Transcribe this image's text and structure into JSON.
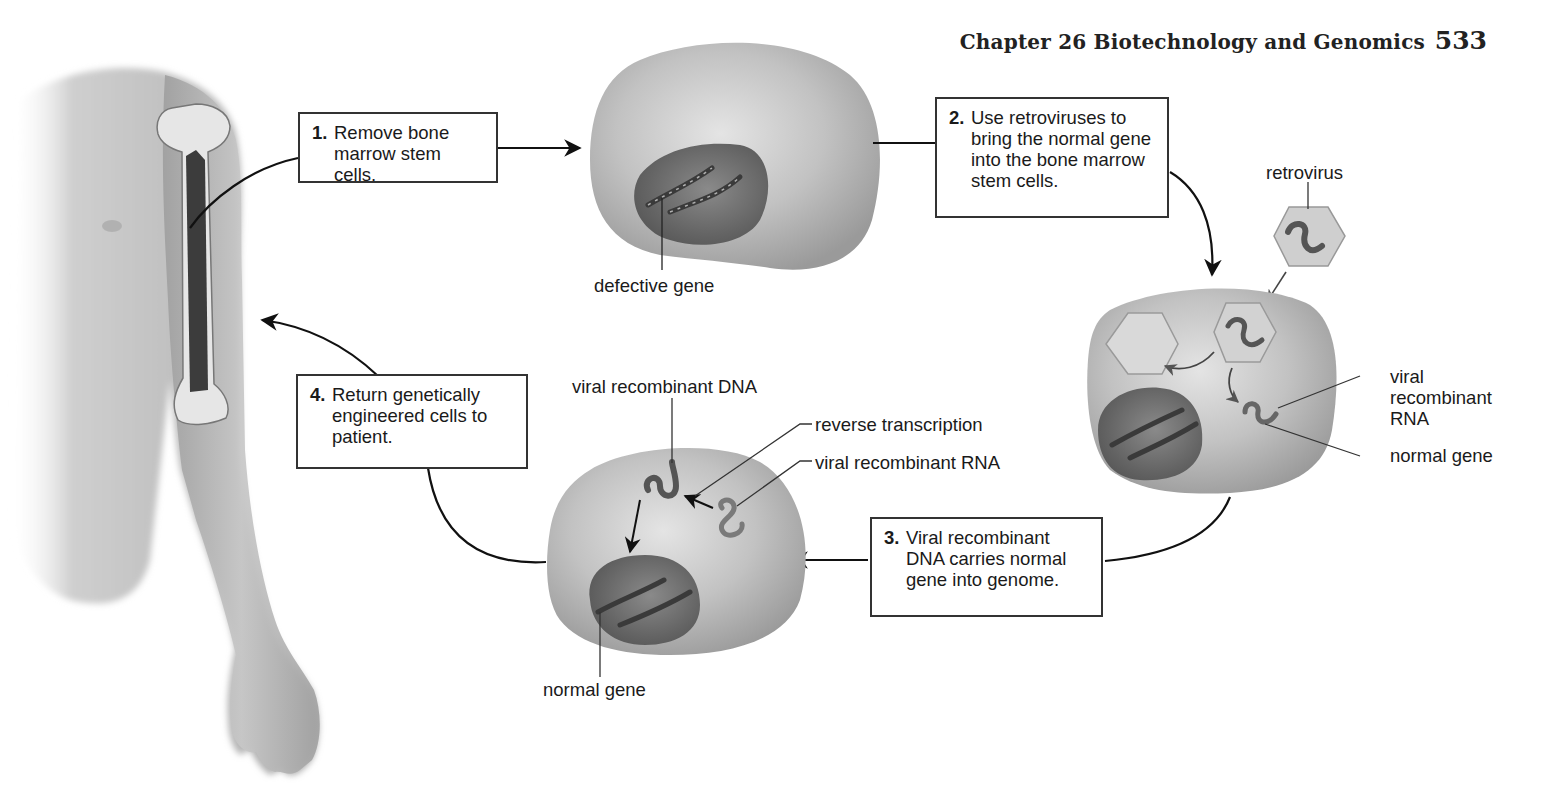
{
  "header": {
    "running_head": "Chapter 26  Biotechnology and Genomics",
    "page_number": "533"
  },
  "figure": {
    "steps": [
      {
        "number": "1.",
        "text": "Remove bone marrow stem cells."
      },
      {
        "number": "2.",
        "text": "Use retroviruses to bring the normal gene into the bone marrow stem cells."
      },
      {
        "number": "3.",
        "text": "Viral recombinant DNA carries normal gene into genome."
      },
      {
        "number": "4.",
        "text": "Return genetically engineered cells to patient."
      }
    ],
    "labels": {
      "defective_gene": "defective gene",
      "retrovirus": "retrovirus",
      "viral_recombinant_rna_right": [
        "viral",
        "recombinant",
        "RNA"
      ],
      "normal_gene_right": "normal gene",
      "viral_recombinant_dna": "viral recombinant DNA",
      "reverse_transcription": "reverse transcription",
      "viral_recombinant_rna_bottom": "viral recombinant RNA",
      "normal_gene_bottom": "normal gene"
    },
    "colors": {
      "cell_fill": "#b8b8b8",
      "nucleus_fill": "#6f6f6f",
      "skin": "#c4c4c4",
      "marrow": "#3c3c3c",
      "line": "#222222"
    }
  }
}
